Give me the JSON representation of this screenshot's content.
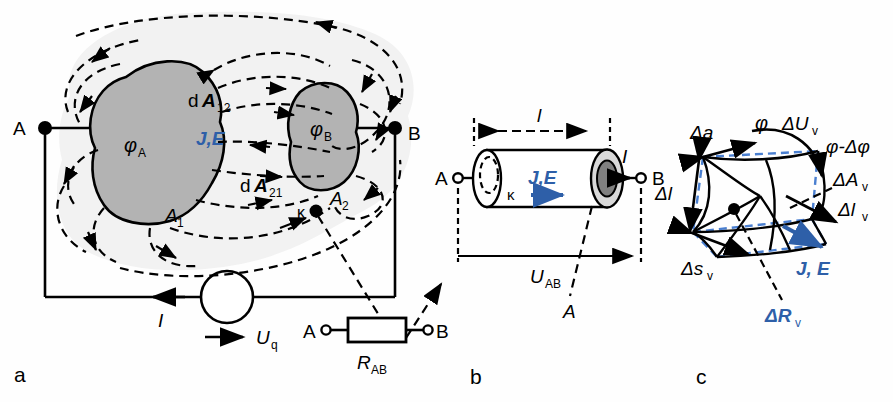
{
  "figure": {
    "panels": [
      {
        "id": "a",
        "letter": "a",
        "caption": "electrode arrangement with conduction field"
      },
      {
        "id": "b",
        "letter": "b",
        "caption": "cylindrical conductor"
      },
      {
        "id": "c",
        "letter": "c",
        "caption": "volume element of the conduction field"
      }
    ],
    "colors": {
      "blue": "#2e5fa8",
      "electrode_fill": "#b3b3b3",
      "halo": "#f2f2f2",
      "outline": "#000000",
      "cap_light": "#d9d9d9",
      "cap_dark": "#808080"
    }
  },
  "panel_a": {
    "letter": "a",
    "terminal_a": "A",
    "terminal_b": "B",
    "potential_a": "φ",
    "potential_a_sub": "A",
    "potential_b": "φ",
    "potential_b_sub": "B",
    "area_1": "A",
    "area_1_sub": "1",
    "area_2": "A",
    "area_2_sub": "2",
    "da_12": "d",
    "da_12_vec": "A",
    "da_12_sub": "12",
    "da_21": "d",
    "da_21_vec": "A",
    "da_21_sub": "21",
    "field_label": "J,E",
    "kappa": "κ",
    "current": "I",
    "source_voltage": "U",
    "source_voltage_sub": "q",
    "resistor_label": "R",
    "resistor_sub": "AB",
    "resistor_terminal_a": "A",
    "resistor_terminal_b": "B"
  },
  "panel_b": {
    "letter": "b",
    "terminal_a": "A",
    "terminal_b": "B",
    "length": "l",
    "kappa": "κ",
    "field_label": "J,E",
    "current": "I",
    "voltage": "U",
    "voltage_sub": "AB",
    "cross_section": "A"
  },
  "panel_c": {
    "letter": "c",
    "delta_a": "Δa",
    "delta_l": "Δl",
    "phi": "φ",
    "delta_u": "ΔU",
    "delta_u_sub": "v",
    "phi_minus": "φ-Δφ",
    "delta_area": "ΔA",
    "delta_area_sub": "v",
    "delta_len": "Δl",
    "delta_len_sub": "v",
    "delta_s": "Δs",
    "delta_s_sub": "v",
    "delta_r": "ΔR",
    "delta_r_sub": "v",
    "field_label": "J, E"
  }
}
